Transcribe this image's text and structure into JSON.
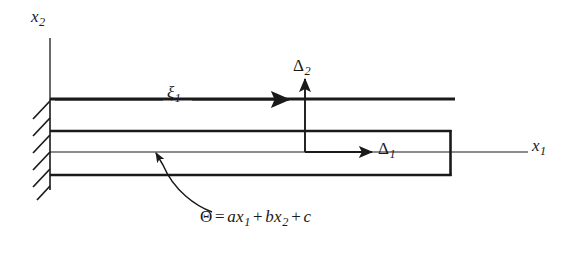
{
  "figure": {
    "stroke_color": "#1a1a1a",
    "background_color": "#ffffff"
  },
  "axes": {
    "vertical": {
      "label_base": "x",
      "label_sub": "2",
      "name": "x2-axis"
    },
    "horizontal": {
      "label_base": "x",
      "label_sub": "1",
      "name": "x1-axis"
    }
  },
  "annotations": {
    "xi": {
      "label_base": "ξ",
      "label_sub": "1",
      "description": "axial coordinate along beam"
    },
    "delta2": {
      "label_base": "Δ",
      "label_sub": "2",
      "description": "transverse tip displacement"
    },
    "delta1": {
      "label_base": "Δ",
      "label_sub": "1",
      "description": "axial tip displacement"
    }
  },
  "equation": {
    "lhs": "Θ",
    "equals": "=",
    "term1_coeff": "a",
    "term1_var": "x",
    "term1_sub": "1",
    "plus1": "+",
    "term2_coeff": "b",
    "term2_var": "x",
    "term2_sub": "2",
    "plus2": "+",
    "term3": "c",
    "full_text": "Θ = ax₁ + bx₂ + c",
    "description": "temperature field distribution over the beam"
  },
  "support": {
    "type": "fixed-support",
    "hatch_count": 6,
    "description": "built-in clamped end indicated by diagonal hatching"
  }
}
